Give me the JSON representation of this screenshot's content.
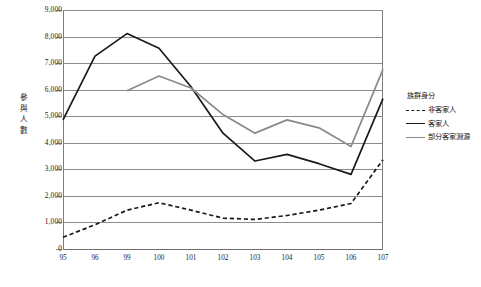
{
  "chart_data": {
    "type": "line",
    "title": "",
    "xlabel": "",
    "ylabel": "參與人數",
    "categories": [
      "95",
      "96",
      "99",
      "100",
      "101",
      "102",
      "103",
      "104",
      "105",
      "106",
      "107"
    ],
    "ylim": [
      0,
      9000
    ],
    "ytick_labels": [
      "9,000",
      "8,000",
      "7,000",
      "6,000",
      "5,000",
      "4,000",
      "3,000",
      "2,000",
      "1,000",
      "0"
    ],
    "ytick_values": [
      9000,
      8000,
      7000,
      6000,
      5000,
      4000,
      3000,
      2000,
      1000,
      0
    ],
    "grid": true,
    "legend_position": "right",
    "legend_title": "族群身分",
    "series": [
      {
        "name": "非客家人",
        "style": "dashed",
        "color": "#1a1a1a",
        "values": [
          480,
          950,
          1500,
          1780,
          1500,
          1200,
          1150,
          1300,
          1500,
          1750,
          3400
        ]
      },
      {
        "name": "客家人",
        "style": "solid",
        "color": "#1a1a1a",
        "values": [
          4900,
          7300,
          8150,
          7600,
          6150,
          4400,
          3350,
          3600,
          3250,
          2850,
          5700
        ]
      },
      {
        "name": "部分客家淵源",
        "style": "solid",
        "color": "#8a8a8a",
        "values": [
          null,
          null,
          6000,
          6550,
          6100,
          5100,
          4400,
          4900,
          4600,
          3900,
          6800
        ]
      }
    ]
  },
  "caption": ""
}
